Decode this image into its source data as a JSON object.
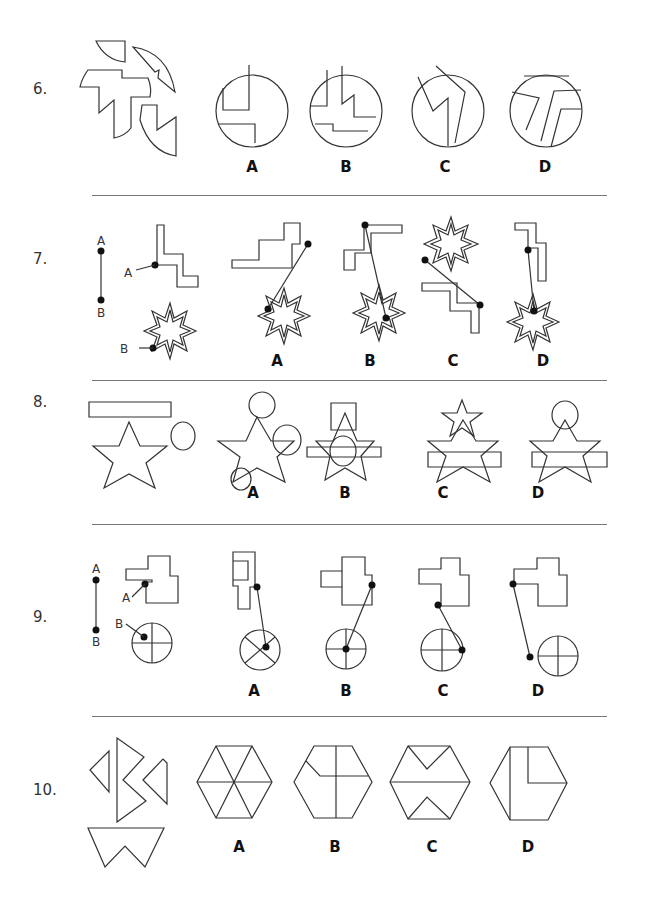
{
  "questions": [
    {
      "number": "6.",
      "options": [
        "A",
        "B",
        "C",
        "D"
      ],
      "description": "Assemble the shape pieces into a circle"
    },
    {
      "number": "7.",
      "options": [
        "A",
        "B",
        "C",
        "D"
      ],
      "description": "Connect point A on the stair shape to point B on the star",
      "point_labels": [
        "A",
        "B"
      ]
    },
    {
      "number": "8.",
      "options": [
        "A",
        "B",
        "C",
        "D"
      ],
      "description": "Combine rectangle, star, and circle"
    },
    {
      "number": "9.",
      "options": [
        "A",
        "B",
        "C",
        "D"
      ],
      "description": "Connect point A on the shape to point B on the divided circle",
      "point_labels": [
        "A",
        "B"
      ]
    },
    {
      "number": "10.",
      "options": [
        "A",
        "B",
        "C",
        "D"
      ],
      "description": "Assemble triangle pieces into a hexagon"
    }
  ],
  "colors": {
    "line": "#333333",
    "background": "#ffffff",
    "divider": "#777777"
  }
}
